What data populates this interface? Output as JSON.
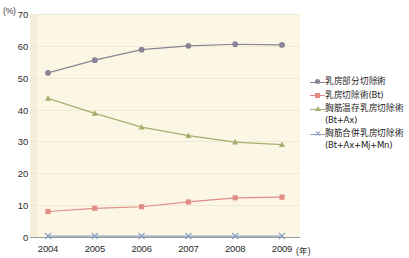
{
  "chart_data": {
    "type": "line",
    "title": "",
    "xlabel": "年",
    "ylabel": "%",
    "unit_label": "(%)",
    "year_suffix": "(年)",
    "categories": [
      "2004",
      "2005",
      "2006",
      "2007",
      "2008",
      "2009"
    ],
    "x": [
      2004,
      2005,
      2006,
      2007,
      2008,
      2009
    ],
    "ylim": [
      0,
      70
    ],
    "yticks": [
      0,
      10,
      20,
      30,
      40,
      50,
      60,
      70
    ],
    "ytick_labels": [
      "0",
      "10",
      "20",
      "30",
      "40",
      "50",
      "60",
      "70"
    ],
    "grid": true,
    "legend_position": "right",
    "plot_background": "#fbf7e4",
    "series": [
      {
        "name": "乳房部分切除術",
        "label_main": "乳房部分切除術",
        "label_sub": "",
        "color": "#8b8199",
        "marker": "circle",
        "values": [
          51.5,
          55.5,
          58.8,
          60.0,
          60.5,
          60.3
        ]
      },
      {
        "name": "乳房切除術(Bt)",
        "label_main": "乳房切除術(Bt)",
        "label_sub": "",
        "color": "#e08d86",
        "marker": "square",
        "values": [
          8.0,
          9.0,
          9.5,
          11.0,
          12.3,
          12.5
        ]
      },
      {
        "name": "胸筋温存乳房切除術(Bt+Ax)",
        "label_main": "胸筋温存乳房切除術",
        "label_sub": "(Bt+Ax)",
        "color": "#a8ae6e",
        "marker": "triangle",
        "values": [
          43.5,
          38.8,
          34.5,
          31.8,
          29.8,
          29.0
        ]
      },
      {
        "name": "胸筋合併乳房切除術(Bt+Ax+Mj+Mn)",
        "label_main": "胸筋合併乳房切除術",
        "label_sub": "(Bt+Ax+Mj+Mn)",
        "color": "#8ea2c4",
        "marker": "cross",
        "values": [
          0.3,
          0.3,
          0.3,
          0.3,
          0.3,
          0.3
        ]
      }
    ]
  },
  "footer": {
    "note": ""
  }
}
